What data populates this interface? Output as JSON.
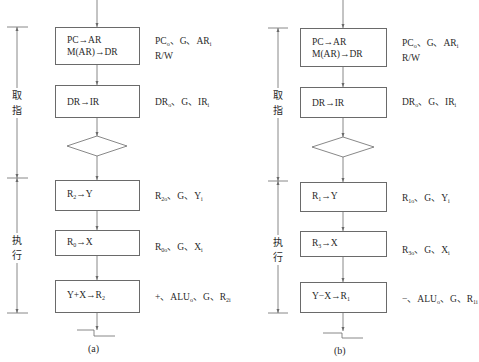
{
  "figure": {
    "panels": [
      {
        "caption": "(a)",
        "phases": {
          "fetch": "取指",
          "execute": "执行"
        },
        "steps": [
          {
            "ops": [
              "PC→AR",
              "M(AR)→DR"
            ],
            "signals": [
              {
                "parts": [
                  "PC",
                  "o",
                  "、G、AR",
                  "i"
                ]
              },
              {
                "text": "R/W"
              }
            ]
          },
          {
            "ops": [
              "DR→IR"
            ],
            "signals": [
              {
                "parts": [
                  "DR",
                  "o",
                  "、G、IR",
                  "i"
                ]
              }
            ]
          },
          {
            "decision": true
          },
          {
            "ops": [
              {
                "parts": [
                  "R",
                  "2",
                  "→Y"
                ]
              }
            ],
            "signals": [
              {
                "parts": [
                  "R",
                  "2o",
                  "、G、Y",
                  "i"
                ]
              }
            ]
          },
          {
            "ops": [
              {
                "parts": [
                  "R",
                  "0",
                  "→X"
                ]
              }
            ],
            "signals": [
              {
                "parts": [
                  "R",
                  "0o",
                  "、G、X",
                  "i"
                ]
              }
            ]
          },
          {
            "ops": [
              {
                "parts": [
                  "Y+X→R",
                  "2",
                  ""
                ]
              }
            ],
            "signals": [
              {
                "parts": [
                  "+、ALU",
                  "o",
                  "、G、R",
                  "2i"
                ]
              }
            ]
          }
        ]
      },
      {
        "caption": "(b)",
        "phases": {
          "fetch": "取指",
          "execute": "执行"
        },
        "steps": [
          {
            "ops": [
              "PC→AR",
              "M(AR)→DR"
            ],
            "signals": [
              {
                "parts": [
                  "PC",
                  "o",
                  "、G、AR",
                  "i"
                ]
              },
              {
                "text": "R/W"
              }
            ]
          },
          {
            "ops": [
              "DR→IR"
            ],
            "signals": [
              {
                "parts": [
                  "DR",
                  "o",
                  "、G、IR",
                  "i"
                ]
              }
            ]
          },
          {
            "decision": true
          },
          {
            "ops": [
              {
                "parts": [
                  "R",
                  "1",
                  "→Y"
                ]
              }
            ],
            "signals": [
              {
                "parts": [
                  "R",
                  "1o",
                  "、G、Y",
                  "i"
                ]
              }
            ]
          },
          {
            "ops": [
              {
                "parts": [
                  "R",
                  "3",
                  "→X"
                ]
              }
            ],
            "signals": [
              {
                "parts": [
                  "R",
                  "3o",
                  "、G、X",
                  "i"
                ]
              }
            ]
          },
          {
            "ops": [
              {
                "parts": [
                  "Y−X→R",
                  "1",
                  ""
                ]
              }
            ],
            "signals": [
              {
                "parts": [
                  "−、ALU",
                  "o",
                  "、G、R",
                  "1i"
                ]
              }
            ]
          }
        ]
      }
    ]
  },
  "text": {
    "a": {
      "caption": "(a)",
      "fetch": "取指",
      "execute": "执行",
      "s1_op1": "PC→AR",
      "s1_op2": "M(AR)→DR",
      "s1_sig_a": "PC",
      "s1_sig_a_sub": "o",
      "s1_sig_b": "、G、AR",
      "s1_sig_b_sub": "i",
      "s1_sig2": "R/W",
      "s2_op": "DR→IR",
      "s2_sig_a": "DR",
      "s2_sig_a_sub": "o",
      "s2_sig_b": "、G、IR",
      "s2_sig_b_sub": "i",
      "s3_op_a": "R",
      "s3_op_sub": "2",
      "s3_op_b": "→Y",
      "s3_sig_a": "R",
      "s3_sig_a_sub": "2o",
      "s3_sig_b": "、G、Y",
      "s3_sig_b_sub": "i",
      "s4_op_a": "R",
      "s4_op_sub": "0",
      "s4_op_b": "→X",
      "s4_sig_a": "R",
      "s4_sig_a_sub": "0o",
      "s4_sig_b": "、G、X",
      "s4_sig_b_sub": "i",
      "s5_op_a": "Y+X→R",
      "s5_op_sub": "2",
      "s5_sig_a": "+、ALU",
      "s5_sig_a_sub": "o",
      "s5_sig_b": "、G、R",
      "s5_sig_b_sub": "2i"
    },
    "b": {
      "caption": "(b)",
      "fetch": "取指",
      "execute": "执行",
      "s1_op1": "PC→AR",
      "s1_op2": "M(AR)→DR",
      "s1_sig_a": "PC",
      "s1_sig_a_sub": "o",
      "s1_sig_b": "、G、AR",
      "s1_sig_b_sub": "i",
      "s1_sig2": "R/W",
      "s2_op": "DR→IR",
      "s2_sig_a": "DR",
      "s2_sig_a_sub": "o",
      "s2_sig_b": "、G、IR",
      "s2_sig_b_sub": "i",
      "s3_op_a": "R",
      "s3_op_sub": "1",
      "s3_op_b": "→Y",
      "s3_sig_a": "R",
      "s3_sig_a_sub": "1o",
      "s3_sig_b": "、G、Y",
      "s3_sig_b_sub": "i",
      "s4_op_a": "R",
      "s4_op_sub": "3",
      "s4_op_b": "→X",
      "s4_sig_a": "R",
      "s4_sig_a_sub": "3o",
      "s4_sig_b": "、G、X",
      "s4_sig_b_sub": "i",
      "s5_op_a": "Y−X→R",
      "s5_op_sub": "1",
      "s5_sig_a": "−、ALU",
      "s5_sig_a_sub": "o",
      "s5_sig_b": "、G、R",
      "s5_sig_b_sub": "1i"
    }
  },
  "colors": {
    "line": "#6a6a6a",
    "text": "#2a2a2a",
    "background": "#ffffff"
  }
}
